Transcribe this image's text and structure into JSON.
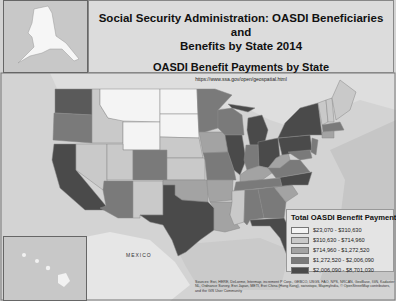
{
  "header": {
    "title": "Social Security Administration: OASDI Beneficiaries and Benefits by State 2014",
    "title_line1": "Social Security Administration: OASDI Beneficiaries and",
    "title_line2": "Benefits by State 2014",
    "subtitle": "OASDI Benefit Payments by State",
    "url": "https://www.ssa.gov/open/geospatial.html"
  },
  "legend": {
    "title": "Total OASDI Benefit Payments",
    "classes": [
      {
        "label": "$23,070 - $310,630",
        "color": "#f4f4f4"
      },
      {
        "label": "$310,630 - $714,960",
        "color": "#c9c9c9"
      },
      {
        "label": "$714,960 - $1,272,520",
        "color": "#a3a3a3"
      },
      {
        "label": "$1,272,520 - $2,006,090",
        "color": "#7a7a7a"
      },
      {
        "label": "$2,006,090 - $8,701,030",
        "color": "#4a4a4a"
      }
    ]
  },
  "labels": {
    "mexico": "MEXICO"
  },
  "attribution": "Sources: Esri, HERE, DeLorme, Intermap, increment P Corp., GEBCO, USGS, FAO, NPS, NRCAN, GeoBase, IGN, Kadaster NL, Ordnance Survey, Esri Japan, METI, Esri China (Hong Kong), swisstopo, MapmyIndia, © OpenStreetMap contributors, and the GIS User Community",
  "insets": [
    "Alaska",
    "Hawaii"
  ]
}
